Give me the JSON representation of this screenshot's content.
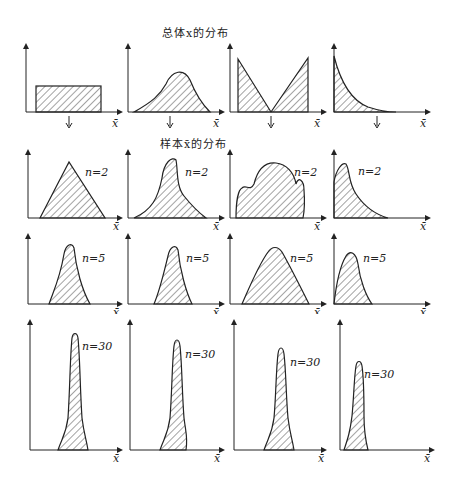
{
  "titles": {
    "population": "总体x的分布",
    "sample": "样本x̄的分布"
  },
  "axis_label": "x̄",
  "rows": [
    {
      "name": "population",
      "label": ""
    },
    {
      "name": "n2",
      "label": "n=2"
    },
    {
      "name": "n5",
      "label": "n=5"
    },
    {
      "name": "n30",
      "label": "n=30"
    }
  ],
  "columns": [
    "uniform",
    "bell",
    "v-shaped",
    "exponential"
  ],
  "colors": {
    "ink": "#222222",
    "hatch": "#333333",
    "background": "#ffffff"
  }
}
